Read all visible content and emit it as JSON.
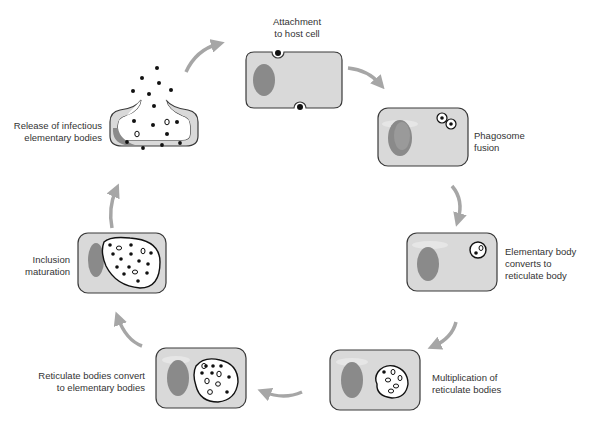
{
  "colors": {
    "cell_fill": "#d9d9d9",
    "cell_stroke": "#3a3a3a",
    "nucleus": "#8a8a8a",
    "arrow": "#a6a6a6",
    "body_dot": "#111111",
    "inclusion_fill": "#ffffff"
  },
  "stages": [
    {
      "id": "attachment",
      "lines": [
        "Attachment",
        "to host cell"
      ]
    },
    {
      "id": "phagosome",
      "lines": [
        "Phagosome",
        "fusion"
      ]
    },
    {
      "id": "eb-to-rb",
      "lines": [
        "Elementary body",
        "converts to",
        "reticulate body"
      ]
    },
    {
      "id": "multiplication",
      "lines": [
        "Multiplication of",
        "reticulate bodies"
      ]
    },
    {
      "id": "rb-to-eb",
      "lines": [
        "Reticulate bodies convert",
        "to elementary bodies"
      ]
    },
    {
      "id": "maturation",
      "lines": [
        "Inclusion",
        "maturation"
      ]
    },
    {
      "id": "release",
      "lines": [
        "Release of infectious",
        "elementary bodies"
      ]
    }
  ]
}
